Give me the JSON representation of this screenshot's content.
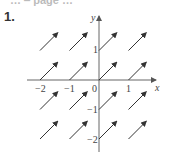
{
  "header_cut_text": "… ‒ page …",
  "problem_number": "1.",
  "diagram": {
    "type": "direction_field",
    "axes": {
      "x_label": "x",
      "y_label": "y",
      "x_ticks": [
        "−2",
        "−1",
        "0",
        "1"
      ],
      "y_ticks": [
        "1",
        "−1",
        "−2"
      ],
      "origin_label": "0"
    },
    "arrow_grid": {
      "x_positions": [
        -2,
        -1,
        0,
        1
      ],
      "y_positions": [
        1,
        0,
        -1,
        -2
      ],
      "direction": [
        0.6,
        0.6
      ],
      "count": 16
    },
    "colors": {
      "axis": "#555555",
      "arrow": "#333333"
    }
  }
}
